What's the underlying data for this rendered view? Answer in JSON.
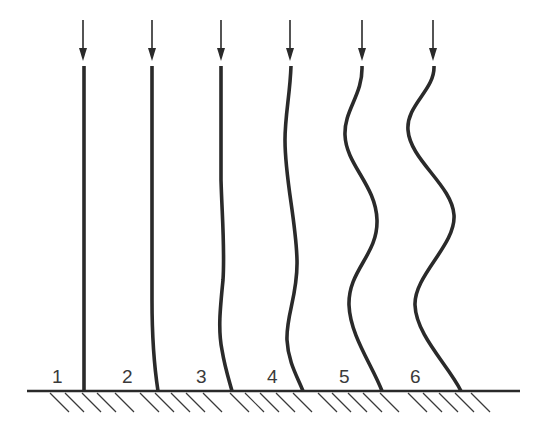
{
  "diagram": {
    "colors": {
      "line": "#2a2a2a",
      "label": "#3a3a3a",
      "background": "#ffffff"
    },
    "columns": [
      {
        "label": "1",
        "label_x": 52,
        "load_arrow": "down-arrow-icon",
        "arrow_x": 83,
        "path": "M84 66 L84 391"
      },
      {
        "label": "2",
        "label_x": 122,
        "load_arrow": "down-arrow-icon",
        "arrow_x": 152,
        "path": "M152 66 L152 300 C152 340 154 365 158 391"
      },
      {
        "label": "3",
        "label_x": 196,
        "load_arrow": "down-arrow-icon",
        "arrow_x": 221,
        "path": "M221 66 L221 180 C222 215 225 250 223 280 C220 310 218 330 222 350 C225 368 229 380 232 391"
      },
      {
        "label": "4",
        "label_x": 267,
        "load_arrow": "down-arrow-icon",
        "arrow_x": 290,
        "path": "M291 66 C290 95 285 115 285 140 C285 180 296 220 297 260 C298 295 286 315 287 340 C288 362 298 378 303 391"
      },
      {
        "label": "5",
        "label_x": 339,
        "load_arrow": "down-arrow-icon",
        "arrow_x": 362,
        "path": "M362 66 C363 95 344 110 345 135 C346 165 376 185 377 220 C378 255 348 270 349 305 C350 335 372 365 382 391"
      },
      {
        "label": "6",
        "label_x": 410,
        "load_arrow": "down-arrow-icon",
        "arrow_x": 433,
        "path": "M434 66 C435 90 406 105 408 130 C410 160 452 185 454 215 C456 245 414 275 415 305 C416 335 448 365 461 391"
      }
    ],
    "ground": {
      "y": 391,
      "x_start": 27,
      "x_end": 520,
      "hatch_icon": "fixed-support-hatch"
    }
  }
}
